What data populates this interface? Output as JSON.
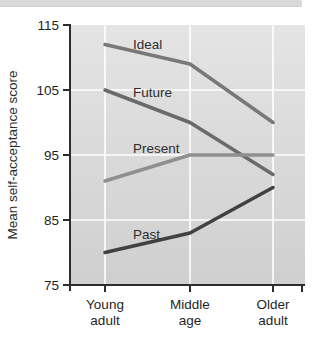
{
  "figure": {
    "kind": "textbook line chart"
  },
  "chart_data": {
    "type": "line",
    "title": "",
    "xlabel": "",
    "ylabel": "Mean self-acceptance score",
    "ylim": [
      75,
      115
    ],
    "yticks": [
      75,
      85,
      95,
      105,
      115
    ],
    "grid": true,
    "legend_position": "inline-labels",
    "categories": [
      "Young adult",
      "Middle age",
      "Older adult"
    ],
    "category_label_lines": [
      [
        "Young",
        "adult"
      ],
      [
        "Middle",
        "age"
      ],
      [
        "Older",
        "adult"
      ]
    ],
    "series": [
      {
        "name": "Ideal",
        "values": [
          112,
          109,
          100
        ],
        "color": "#787878",
        "label": {
          "text": "Ideal",
          "x": 133,
          "y": 49
        }
      },
      {
        "name": "Future",
        "values": [
          105,
          100,
          92
        ],
        "color": "#6a6a6a",
        "label": {
          "text": "Future",
          "x": 133,
          "y": 97
        }
      },
      {
        "name": "Present",
        "values": [
          91,
          95,
          95
        ],
        "color": "#8f8f8f",
        "label": {
          "text": "Present",
          "x": 133,
          "y": 153
        }
      },
      {
        "name": "Past",
        "values": [
          80,
          83,
          90
        ],
        "color": "#414141",
        "label": {
          "text": "Past",
          "x": 133,
          "y": 239
        }
      }
    ],
    "colors": {
      "plot_bg_top": "#e4e4e4",
      "plot_bg_bottom": "#cfcfcf",
      "gridline": "#ffffff",
      "axis": "#2d2d2d",
      "tick_label": "#1f1f1f",
      "series_label": "#2e2e2e",
      "axis_title": "#2b2b2b",
      "top_band": "#d9d9d9"
    }
  }
}
